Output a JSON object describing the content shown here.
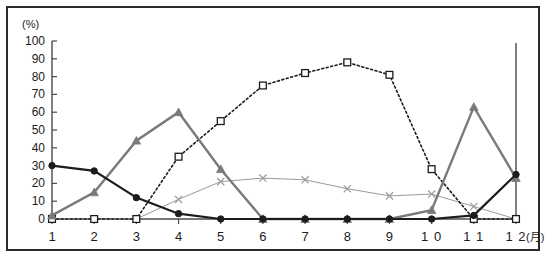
{
  "chart": {
    "y_axis_unit": "(%)",
    "x_axis_unit": "(月)",
    "y_ticks": [
      "100",
      "90",
      "80",
      "70",
      "60",
      "50",
      "40",
      "30",
      "20",
      "10",
      "0"
    ],
    "x_ticks": [
      "1",
      "2",
      "3",
      "4",
      "5",
      "6",
      "7",
      "8",
      "9",
      "1 0",
      "1 1",
      "1 2"
    ]
  },
  "chart_data": {
    "type": "line",
    "title": "",
    "xlabel": "(月)",
    "ylabel": "(%)",
    "ylim": [
      0,
      100
    ],
    "xlim": [
      1,
      12
    ],
    "grid": false,
    "legend": "none",
    "categories": [
      1,
      2,
      3,
      4,
      5,
      6,
      7,
      8,
      9,
      10,
      11,
      12
    ],
    "series": [
      {
        "name": "black-circle-series",
        "marker": "filled-circle",
        "line_style": "solid",
        "color": "#1c1c1c",
        "values": [
          30,
          27,
          12,
          3,
          0,
          0,
          0,
          0,
          0,
          0,
          2,
          25
        ]
      },
      {
        "name": "gray-triangle-series",
        "marker": "filled-triangle",
        "line_style": "solid",
        "color": "#7a7a7a",
        "values": [
          2,
          15,
          44,
          60,
          28,
          0,
          0,
          0,
          0,
          5,
          63,
          23
        ]
      },
      {
        "name": "white-square-series",
        "marker": "open-square",
        "line_style": "dotted",
        "color": "#1c1c1c",
        "values": [
          0,
          0,
          0,
          35,
          55,
          75,
          82,
          88,
          81,
          28,
          0,
          0
        ]
      },
      {
        "name": "gray-cross-series",
        "marker": "cross",
        "line_style": "solid-thin",
        "color": "#9a9a9a",
        "values": [
          0,
          0,
          0,
          11,
          21,
          23,
          22,
          17,
          13,
          14,
          7,
          0
        ]
      }
    ]
  }
}
